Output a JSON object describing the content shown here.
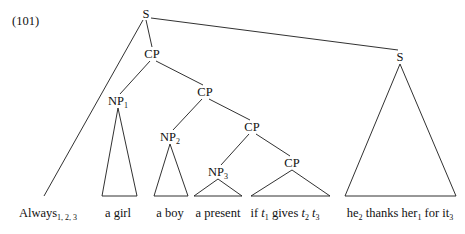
{
  "figure": {
    "example_number": "(101)",
    "type": "syntax-tree"
  },
  "nodes": [
    {
      "name": "root-s",
      "label": "S",
      "sub": "",
      "x": 146,
      "y": 14
    },
    {
      "name": "cp-1",
      "label": "CP",
      "sub": "",
      "x": 152,
      "y": 54
    },
    {
      "name": "cp-2",
      "label": "CP",
      "sub": "",
      "x": 205,
      "y": 92
    },
    {
      "name": "cp-3",
      "label": "CP",
      "sub": "",
      "x": 252,
      "y": 127
    },
    {
      "name": "cp-4",
      "label": "CP",
      "sub": "",
      "x": 292,
      "y": 163
    },
    {
      "name": "np-1",
      "label": "NP",
      "sub": "1",
      "x": 118,
      "y": 101
    },
    {
      "name": "np-2",
      "label": "NP",
      "sub": "2",
      "x": 170,
      "y": 137
    },
    {
      "name": "np-3",
      "label": "NP",
      "sub": "3",
      "x": 218,
      "y": 172
    },
    {
      "name": "right-s",
      "label": "S",
      "sub": "",
      "x": 400,
      "y": 57
    }
  ],
  "terminals": [
    {
      "name": "terminal-always",
      "text": "Always",
      "sub": "1, 2, 3",
      "x": 48,
      "y": 207
    },
    {
      "name": "terminal-a-girl",
      "text": "a girl",
      "sub": "",
      "x": 118,
      "y": 207
    },
    {
      "name": "terminal-a-boy",
      "text": "a boy",
      "sub": "",
      "x": 170,
      "y": 207
    },
    {
      "name": "terminal-a-present",
      "text": "a present",
      "sub": "",
      "x": 218,
      "y": 207
    }
  ],
  "terminal_if_clause": {
    "name": "terminal-if-clause",
    "x": 285,
    "y": 207,
    "parts": [
      {
        "text": "if ",
        "italic": false,
        "sub": ""
      },
      {
        "text": "t",
        "italic": true,
        "sub": "1"
      },
      {
        "text": " gives ",
        "italic": false,
        "sub": ""
      },
      {
        "text": "t",
        "italic": true,
        "sub": "2"
      },
      {
        "text": " ",
        "italic": false,
        "sub": ""
      },
      {
        "text": "t",
        "italic": true,
        "sub": "3"
      }
    ]
  },
  "terminal_main_clause": {
    "name": "terminal-main-clause",
    "x": 400,
    "y": 207,
    "parts": [
      {
        "text": "he",
        "italic": false,
        "sub": "2"
      },
      {
        "text": " thanks her",
        "italic": false,
        "sub": "1"
      },
      {
        "text": " for it",
        "italic": false,
        "sub": "3"
      }
    ]
  },
  "branches": [
    {
      "name": "branch-root-s-to-cp-1",
      "x1": 146,
      "y1": 20,
      "x2": 152,
      "y2": 47
    },
    {
      "name": "branch-root-s-to-right-s",
      "x1": 151,
      "y1": 18,
      "x2": 398,
      "y2": 50
    },
    {
      "name": "branch-root-s-to-always",
      "x1": 143,
      "y1": 20,
      "x2": 44,
      "y2": 196
    },
    {
      "name": "branch-cp1-to-np1",
      "x1": 150,
      "y1": 61,
      "x2": 120,
      "y2": 94
    },
    {
      "name": "branch-cp1-to-cp2",
      "x1": 156,
      "y1": 61,
      "x2": 203,
      "y2": 85
    },
    {
      "name": "branch-cp2-to-np2",
      "x1": 202,
      "y1": 99,
      "x2": 173,
      "y2": 130
    },
    {
      "name": "branch-cp2-to-cp3",
      "x1": 209,
      "y1": 99,
      "x2": 250,
      "y2": 120
    },
    {
      "name": "branch-cp3-to-np3",
      "x1": 249,
      "y1": 134,
      "x2": 221,
      "y2": 165
    },
    {
      "name": "branch-cp3-to-cp4",
      "x1": 256,
      "y1": 134,
      "x2": 290,
      "y2": 156
    }
  ],
  "triangles": [
    {
      "name": "triangle-np1",
      "apex_x": 118,
      "apex_y": 108,
      "left_x": 102,
      "right_x": 137,
      "base_y": 196
    },
    {
      "name": "triangle-np2",
      "apex_x": 170,
      "apex_y": 144,
      "left_x": 154,
      "right_x": 188,
      "base_y": 196
    },
    {
      "name": "triangle-np3",
      "apex_x": 218,
      "apex_y": 179,
      "left_x": 194,
      "right_x": 242,
      "base_y": 196
    },
    {
      "name": "triangle-cp4",
      "apex_x": 292,
      "apex_y": 170,
      "left_x": 251,
      "right_x": 330,
      "base_y": 196
    },
    {
      "name": "triangle-right-s",
      "apex_x": 400,
      "apex_y": 64,
      "left_x": 345,
      "right_x": 456,
      "base_y": 196
    }
  ],
  "style": {
    "line_color": "#1a1a1a",
    "text_color": "#111111",
    "background": "#ffffff"
  }
}
